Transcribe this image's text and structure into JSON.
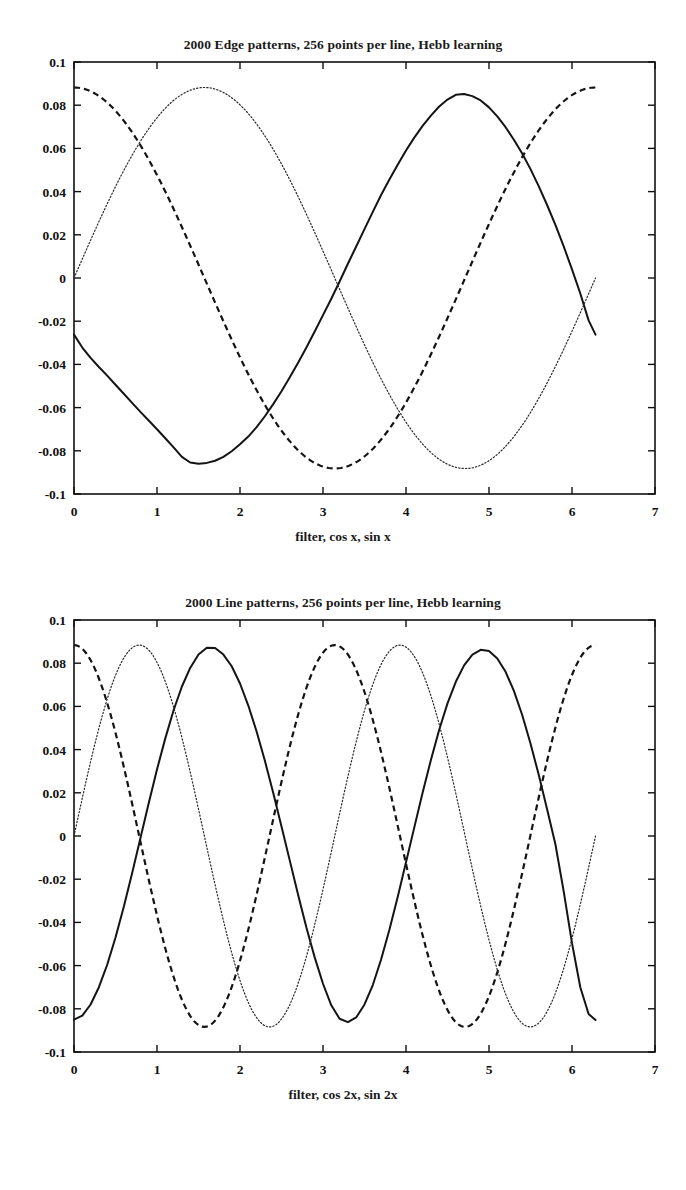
{
  "page": {
    "background": "#ffffff",
    "ink": "#141414"
  },
  "chart_data": [
    {
      "id": "edge-panel",
      "type": "line",
      "title": "2000 Edge patterns, 256 points per line, Hebb learning",
      "xlabel": "filter, cos x, sin x",
      "ylabel": "",
      "xlim": [
        0,
        7
      ],
      "ylim": [
        -0.1,
        0.1
      ],
      "xticks": [
        0,
        1,
        2,
        3,
        4,
        5,
        6,
        7
      ],
      "xticklabels": [
        "0",
        "1",
        "2",
        "3",
        "4",
        "5",
        "6",
        "7"
      ],
      "yticks": [
        -0.1,
        -0.08,
        -0.06,
        -0.04,
        -0.02,
        0,
        0.02,
        0.04,
        0.06,
        0.08,
        0.1
      ],
      "yticklabels": [
        "-0.1",
        "-0.08",
        "-0.06",
        "-0.04",
        "-0.02",
        "0",
        "0.02",
        "0.04",
        "0.06",
        "0.08",
        "0.1"
      ],
      "grid": false,
      "legend": "none",
      "xdata_end": 6.2832,
      "series": [
        {
          "name": "filter",
          "style": "solid",
          "amplitude": 0.0855,
          "frequency": 1,
          "phase_deg": 252,
          "noise": 0.0022,
          "comment": "learned filter; starts -0.026 at x=0, min -0.086 near x=1.35, max 0.085 near x=4.6, ends -0.026",
          "x": [
            0.0,
            0.1,
            0.2,
            0.3,
            0.4,
            0.5,
            0.6,
            0.7,
            0.8,
            0.9,
            1.0,
            1.1,
            1.2,
            1.3,
            1.4,
            1.5,
            1.6,
            1.7,
            1.8,
            1.9,
            2.0,
            2.1,
            2.2,
            2.3,
            2.4,
            2.5,
            2.6,
            2.7,
            2.8,
            2.9,
            3.0,
            3.1,
            3.2,
            3.3,
            3.4,
            3.5,
            3.6,
            3.7,
            3.8,
            3.9,
            4.0,
            4.1,
            4.2,
            4.3,
            4.4,
            4.5,
            4.6,
            4.7,
            4.8,
            4.9,
            5.0,
            5.1,
            5.2,
            5.3,
            5.4,
            5.5,
            5.6,
            5.7,
            5.8,
            5.9,
            6.0,
            6.1,
            6.2,
            6.2832
          ],
          "y": [
            -0.0262,
            -0.0322,
            -0.037,
            -0.0412,
            -0.0452,
            -0.0494,
            -0.0536,
            -0.0578,
            -0.062,
            -0.066,
            -0.07,
            -0.0742,
            -0.0784,
            -0.0828,
            -0.0854,
            -0.086,
            -0.0856,
            -0.0846,
            -0.0828,
            -0.0802,
            -0.077,
            -0.0734,
            -0.069,
            -0.064,
            -0.0584,
            -0.0524,
            -0.046,
            -0.0392,
            -0.0322,
            -0.0248,
            -0.0172,
            -0.0096,
            -0.0016,
            0.0066,
            0.0146,
            0.0226,
            0.0306,
            0.0384,
            0.0456,
            0.0524,
            0.059,
            0.065,
            0.0704,
            0.0752,
            0.0794,
            0.0826,
            0.0848,
            0.0852,
            0.0842,
            0.0822,
            0.079,
            0.0748,
            0.0698,
            0.064,
            0.0576,
            0.0504,
            0.0424,
            0.0338,
            0.0246,
            0.0146,
            0.004,
            -0.0072,
            -0.0196,
            -0.0262
          ]
        },
        {
          "name": "cos x",
          "style": "dashed",
          "amplitude": 0.0882,
          "frequency": 1,
          "phase_deg": 0,
          "noise": 0,
          "comment": "0.0882*cos(x): starts 0.0882, trough -0.0882 at pi, back to 0.0882 at 2pi"
        },
        {
          "name": "sin x",
          "style": "dotted",
          "amplitude": 0.0882,
          "frequency": 1,
          "phase_deg": -90,
          "noise": 0,
          "comment": "0.0882*sin(x): starts 0, peak 0.0882 at pi/2, trough -0.0882 at 3pi/2, ends ~0"
        }
      ]
    },
    {
      "id": "line-panel",
      "type": "line",
      "title": "2000 Line patterns, 256 points per line, Hebb learning",
      "xlabel": "filter, cos 2x, sin 2x",
      "ylabel": "",
      "xlim": [
        0,
        7
      ],
      "ylim": [
        -0.1,
        0.1
      ],
      "xticks": [
        0,
        1,
        2,
        3,
        4,
        5,
        6,
        7
      ],
      "xticklabels": [
        "0",
        "1",
        "2",
        "3",
        "4",
        "5",
        "6",
        "7"
      ],
      "yticks": [
        -0.1,
        -0.08,
        -0.06,
        -0.04,
        -0.02,
        0,
        0.02,
        0.04,
        0.06,
        0.08,
        0.1
      ],
      "yticklabels": [
        "-0.1",
        "-0.08",
        "-0.06",
        "-0.04",
        "-0.02",
        "0",
        "0.02",
        "0.04",
        "0.06",
        "0.08",
        "0.1"
      ],
      "grid": false,
      "legend": "none",
      "xdata_end": 6.2832,
      "series": [
        {
          "name": "filter",
          "style": "solid",
          "amplitude": 0.0872,
          "frequency": 2,
          "phase_deg": 180,
          "noise": 0.0018,
          "comment": "learned filter; starts -0.085 at x=0, peaks 0.087 near x=1.5 and x=4.65, troughs near x=0, 3.1, 6.28",
          "x": [
            0.0,
            0.1,
            0.2,
            0.3,
            0.4,
            0.5,
            0.6,
            0.7,
            0.8,
            0.9,
            1.0,
            1.1,
            1.2,
            1.3,
            1.4,
            1.5,
            1.6,
            1.7,
            1.8,
            1.9,
            2.0,
            2.1,
            2.2,
            2.3,
            2.4,
            2.5,
            2.6,
            2.7,
            2.8,
            2.9,
            3.0,
            3.1,
            3.2,
            3.3,
            3.4,
            3.5,
            3.6,
            3.7,
            3.8,
            3.9,
            4.0,
            4.1,
            4.2,
            4.3,
            4.4,
            4.5,
            4.6,
            4.7,
            4.8,
            4.9,
            5.0,
            5.1,
            5.2,
            5.3,
            5.4,
            5.5,
            5.6,
            5.7,
            5.8,
            5.9,
            6.0,
            6.1,
            6.2,
            6.2832
          ],
          "y": [
            -0.085,
            -0.0832,
            -0.078,
            -0.07,
            -0.0596,
            -0.047,
            -0.0328,
            -0.0172,
            -0.001,
            0.0152,
            0.0308,
            0.0452,
            0.0582,
            0.0692,
            0.0778,
            0.084,
            0.0872,
            0.087,
            0.084,
            0.0786,
            0.0706,
            0.0604,
            0.0484,
            0.0348,
            0.02,
            0.0044,
            -0.0114,
            -0.0272,
            -0.0424,
            -0.0562,
            -0.0684,
            -0.0784,
            -0.0846,
            -0.0862,
            -0.084,
            -0.078,
            -0.069,
            -0.0572,
            -0.0434,
            -0.0282,
            -0.0122,
            0.004,
            0.02,
            0.0352,
            0.0492,
            0.0614,
            0.0714,
            0.079,
            0.084,
            0.0862,
            0.0856,
            0.0822,
            0.076,
            0.0672,
            0.056,
            0.0428,
            0.0282,
            0.0124,
            -0.0038,
            -0.0256,
            -0.0496,
            -0.07,
            -0.0824,
            -0.0852
          ]
        },
        {
          "name": "cos 2x",
          "style": "dashed",
          "amplitude": 0.0884,
          "frequency": 2,
          "phase_deg": 0,
          "noise": 0,
          "comment": "0.0884*cos(2x): starts 0.0884, troughs at pi/2 and 3pi/2, ends 0.0884"
        },
        {
          "name": "sin 2x",
          "style": "dotted",
          "amplitude": 0.0884,
          "frequency": 2,
          "phase_deg": -90,
          "noise": 0,
          "comment": "0.0884*sin(2x): starts 0, peaks at pi/4 and 5pi/4, troughs at 3pi/4 and 7pi/4, ends ~0"
        }
      ]
    }
  ]
}
